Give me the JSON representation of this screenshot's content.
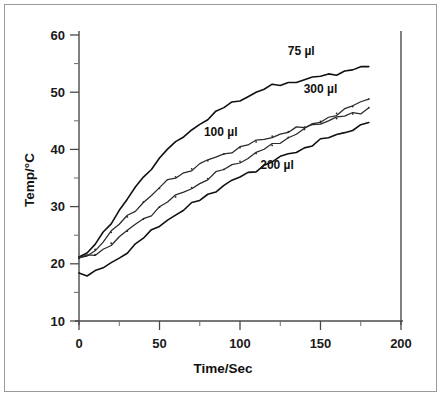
{
  "figure": {
    "border_color": "#9a9a9a",
    "background": "#ffffff"
  },
  "axes": {
    "x_title": "Time/Sec",
    "y_title": "Temp/°C",
    "x_ticks": [
      "0",
      "50",
      "100",
      "150",
      "200"
    ],
    "y_ticks": [
      "10",
      "20",
      "30",
      "40",
      "50",
      "60"
    ]
  },
  "labels": {
    "s75": "75  µl",
    "s100": "100  µl",
    "s200": "200  µl",
    "s300": "300  µl"
  },
  "chart_data": {
    "type": "line",
    "title": "",
    "subtitle": "",
    "xlabel": "Time/Sec",
    "ylabel": "Temp/°C",
    "xlim": [
      0,
      200
    ],
    "ylim": [
      10,
      60
    ],
    "x_major_tick_step": 50,
    "x_minor_tick_step": 25,
    "y_major_tick_step": 10,
    "y_minor_tick_step": 5,
    "grid": false,
    "legend_position": "inline-annotations",
    "annotations": [
      {
        "text": "75  µl",
        "x": 138,
        "y": 56.5
      },
      {
        "text": "300  µl",
        "x": 150,
        "y": 49.8
      },
      {
        "text": "100  µl",
        "x": 88,
        "y": 42.3
      },
      {
        "text": "200  µl",
        "x": 123,
        "y": 36.5
      }
    ],
    "x": [
      0,
      5,
      10,
      15,
      20,
      25,
      30,
      35,
      40,
      45,
      50,
      55,
      60,
      65,
      70,
      75,
      80,
      85,
      90,
      95,
      100,
      105,
      110,
      115,
      120,
      125,
      130,
      135,
      140,
      145,
      150,
      155,
      160,
      165,
      170,
      175,
      180
    ],
    "series": [
      {
        "name": "75  µl",
        "color": "#111111",
        "values": [
          21.2,
          21.6,
          23.4,
          25.4,
          27.4,
          29.3,
          31.3,
          33.2,
          35.0,
          36.8,
          38.5,
          40.3,
          41.0,
          42.1,
          43.4,
          44.5,
          45.5,
          46.4,
          47.3,
          48.0,
          48.7,
          49.4,
          50.0,
          50.5,
          51.0,
          51.4,
          51.7,
          52.0,
          52.1,
          52.4,
          52.8,
          53.1,
          53.4,
          53.6,
          53.9,
          54.2,
          54.4
        ]
      },
      {
        "name": "100  µl",
        "color": "#2a2a2a",
        "values": [
          21.1,
          21.3,
          22.5,
          24.0,
          25.5,
          26.9,
          28.2,
          29.5,
          30.8,
          32.0,
          33.2,
          34.4,
          35.2,
          35.9,
          36.6,
          37.3,
          38.0,
          38.6,
          39.2,
          39.8,
          40.3,
          40.8,
          41.3,
          41.8,
          42.3,
          42.7,
          43.1,
          43.5,
          43.9,
          44.3,
          44.7,
          45.1,
          45.4,
          45.8,
          46.2,
          46.6,
          47.3
        ]
      },
      {
        "name": "200  µl",
        "color": "#111111",
        "values": [
          18.4,
          18.2,
          18.5,
          19.2,
          20.1,
          21.1,
          22.2,
          23.3,
          24.5,
          25.6,
          26.7,
          27.8,
          28.6,
          29.4,
          30.3,
          31.2,
          32.1,
          32.9,
          33.7,
          34.4,
          35.1,
          35.8,
          36.5,
          37.2,
          37.9,
          38.5,
          39.1,
          39.7,
          40.3,
          40.9,
          41.5,
          42.0,
          42.5,
          43.1,
          43.6,
          44.1,
          44.7
        ]
      },
      {
        "name": "300  µl",
        "color": "#2a2a2a",
        "values": [
          21.0,
          21.2,
          21.6,
          22.5,
          23.6,
          24.6,
          25.7,
          26.8,
          27.8,
          28.8,
          29.9,
          30.9,
          31.7,
          32.5,
          33.3,
          34.1,
          34.9,
          35.7,
          36.5,
          37.2,
          37.9,
          38.6,
          39.3,
          40.0,
          40.7,
          41.4,
          42.1,
          42.8,
          43.5,
          44.2,
          44.9,
          45.6,
          46.3,
          46.9,
          47.5,
          48.2,
          48.8
        ]
      }
    ]
  }
}
